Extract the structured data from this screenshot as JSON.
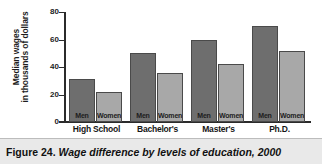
{
  "caption": {
    "label": "Figure 24.",
    "title": "Wage difference by levels of education, 2000"
  },
  "chart_data": {
    "type": "bar",
    "title": "",
    "xlabel": "",
    "ylabel_line1": "Median wages",
    "ylabel_line2": "in thousands of dollars",
    "ylim": [
      0,
      80
    ],
    "yticks": [
      0,
      20,
      40,
      60,
      80
    ],
    "ytick_labels": [
      "0",
      "20",
      "40",
      "60",
      "80"
    ],
    "grid": false,
    "legend": "in-bar",
    "categories": [
      "High School",
      "Bachelor's",
      "Master's",
      "Ph.D."
    ],
    "series": [
      {
        "name": "Men",
        "color": "#6e6e6e",
        "values": [
          31,
          50,
          60,
          70
        ]
      },
      {
        "name": "Women",
        "color": "#a8a8a8",
        "values": [
          22,
          36,
          42,
          52
        ]
      }
    ],
    "bar_labels": [
      "Men",
      "Women",
      "Men",
      "Women",
      "Men",
      "Women",
      "Men",
      "Women"
    ]
  }
}
